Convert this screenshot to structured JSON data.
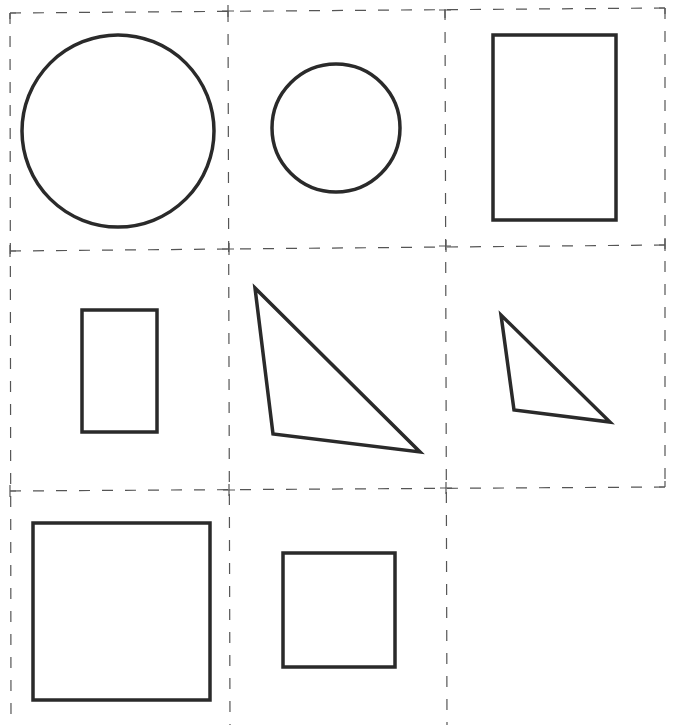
{
  "page": {
    "title_fragment": "",
    "stroke_color": "#2a2a2a",
    "grid_color": "#555555",
    "background": "#ffffff"
  },
  "grid": {
    "columns_x": [
      10,
      228,
      445,
      665
    ],
    "rows_y": [
      11,
      247,
      489
    ],
    "bottom_y": 725,
    "cells": [
      {
        "row": 0,
        "col": 0,
        "shape": "circle",
        "label": "large circle"
      },
      {
        "row": 0,
        "col": 1,
        "shape": "circle",
        "label": "small circle"
      },
      {
        "row": 0,
        "col": 2,
        "shape": "rectangle",
        "label": "large rectangle"
      },
      {
        "row": 1,
        "col": 0,
        "shape": "rectangle",
        "label": "small rectangle"
      },
      {
        "row": 1,
        "col": 1,
        "shape": "triangle",
        "label": "large triangle"
      },
      {
        "row": 1,
        "col": 2,
        "shape": "triangle",
        "label": "small triangle"
      },
      {
        "row": 2,
        "col": 0,
        "shape": "square",
        "label": "large square"
      },
      {
        "row": 2,
        "col": 1,
        "shape": "square",
        "label": "small square"
      },
      {
        "row": 2,
        "col": 2,
        "shape": "none",
        "label": "empty cell"
      }
    ]
  },
  "shapes": {
    "large_circle": {
      "cx": 118,
      "cy": 131,
      "r": 96
    },
    "small_circle": {
      "cx": 336,
      "cy": 128,
      "r": 64
    },
    "large_rectangle": {
      "x": 493,
      "y": 35,
      "width": 123,
      "height": 185
    },
    "small_rectangle": {
      "x": 82,
      "y": 310,
      "width": 75,
      "height": 122
    },
    "large_triangle": {
      "points": "255,288 273,434 420,452"
    },
    "small_triangle": {
      "points": "501,315 514,410 610,422"
    },
    "large_square": {
      "x": 33,
      "y": 523,
      "width": 177,
      "height": 177
    },
    "small_square": {
      "x": 283,
      "y": 553,
      "width": 112,
      "height": 114
    }
  }
}
